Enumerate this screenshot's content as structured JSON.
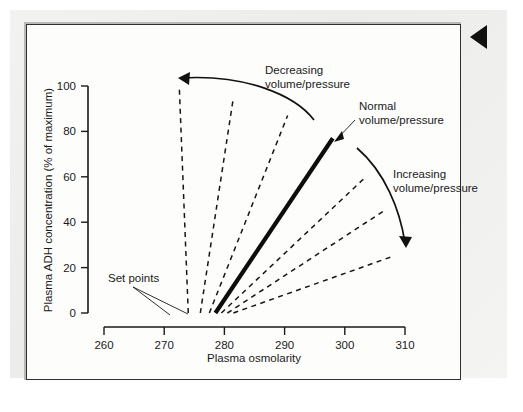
{
  "figure": {
    "marker_icon": "left-triangle-marker",
    "background_color": "#ececeb",
    "frame_color": "#2f2f2f",
    "plot_background": "#fdfdfc"
  },
  "chart_data": {
    "type": "line",
    "title": "",
    "xlabel": "Plasma osmolarity",
    "ylabel": "Plasma ADH concentration (% of maximum)",
    "xlim": [
      258,
      312
    ],
    "ylim": [
      0,
      100
    ],
    "xticks": [
      260,
      270,
      280,
      290,
      300,
      310
    ],
    "yticks": [
      0,
      20,
      40,
      60,
      80,
      100
    ],
    "grid": false,
    "legend_position": "none",
    "series": [
      {
        "name": "Decreasing volume/pressure - line 3",
        "style": "dashed",
        "set_point": 274.0,
        "points": [
          [
            274.0,
            0
          ],
          [
            272.5,
            100
          ]
        ]
      },
      {
        "name": "Decreasing volume/pressure - line 2",
        "style": "dashed",
        "set_point": 276.0,
        "points": [
          [
            276.0,
            0
          ],
          [
            281.5,
            95
          ]
        ]
      },
      {
        "name": "Decreasing volume/pressure - line 1",
        "style": "dashed",
        "set_point": 277.5,
        "points": [
          [
            277.5,
            0
          ],
          [
            290.5,
            87
          ]
        ]
      },
      {
        "name": "Normal volume/pressure",
        "style": "solid-bold",
        "set_point": 278.5,
        "points": [
          [
            278.5,
            0
          ],
          [
            298.0,
            77
          ]
        ]
      },
      {
        "name": "Increasing volume/pressure - line 1",
        "style": "dashed",
        "set_point": 279.5,
        "points": [
          [
            279.5,
            0
          ],
          [
            303.5,
            60
          ]
        ]
      },
      {
        "name": "Increasing volume/pressure - line 2",
        "style": "dashed",
        "set_point": 280.5,
        "points": [
          [
            280.5,
            0
          ],
          [
            306.5,
            45
          ]
        ]
      },
      {
        "name": "Increasing volume/pressure - line 3",
        "style": "dashed",
        "set_point": 281.5,
        "points": [
          [
            281.5,
            0
          ],
          [
            308.0,
            25
          ]
        ]
      }
    ],
    "annotations": [
      {
        "id": "decreasing",
        "text_line1": "Decreasing",
        "text_line2": "volume/pressure",
        "arrow": "curved-arrow-left"
      },
      {
        "id": "normal",
        "text_line1": "Normal",
        "text_line2": "volume/pressure",
        "arrow": "straight-leader-down-left"
      },
      {
        "id": "increasing",
        "text_line1": "Increasing",
        "text_line2": "volume/pressure",
        "arrow": "curved-arrow-down-right"
      },
      {
        "id": "set-points",
        "text_line1": "Set points",
        "text_line2": "",
        "arrow": "two-leader-lines-down-right"
      }
    ]
  }
}
